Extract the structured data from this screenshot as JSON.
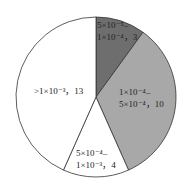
{
  "chart_data": {
    "type": "pie",
    "title": "",
    "total": 30,
    "slices": [
      {
        "label": "5×10⁻⁵–1×10⁻⁴",
        "value": 3,
        "color": "#6e6e6e"
      },
      {
        "label": "1×10⁻⁴–5×10⁻⁴",
        "value": 10,
        "color": "#a8a8a8"
      },
      {
        "label": "5×10⁻⁴–1×10⁻³",
        "value": 4,
        "color": "#ffffff"
      },
      {
        "label": ">1×10⁻³",
        "value": 13,
        "color": "#ffffff"
      }
    ],
    "start_angle_deg": 0,
    "direction": "clockwise",
    "legend": "none",
    "labels_inside": true
  },
  "labels": {
    "s0_line1": "5×10⁻⁵–",
    "s0_line2": "1×10⁻⁴，3",
    "s1_line1": "1×10⁻⁴–",
    "s1_line2": "5×10⁻⁴，10",
    "s2_line1": "5×10⁻⁴–",
    "s2_line2": "1×10⁻³，4",
    "s3_line1": ">1×10⁻³，13"
  }
}
